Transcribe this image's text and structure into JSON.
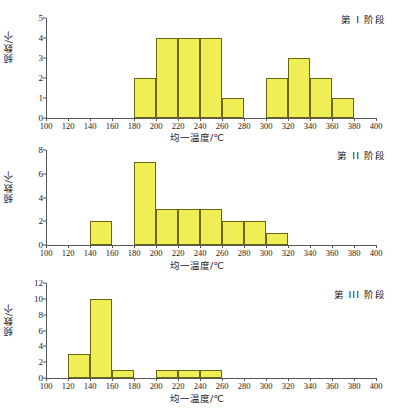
{
  "figure": {
    "axis_title_x": "均一温度/℃",
    "axis_title_y": "频数/个",
    "bar_fill": "#efee55",
    "bar_stroke": "#6b6616",
    "axis_color": "#555555"
  },
  "chart_data": [
    {
      "type": "bar",
      "title": "第 I 阶段",
      "xlabel": "均一温度/℃",
      "ylabel": "频数/个",
      "xlim": [
        100,
        400
      ],
      "ylim": [
        0,
        5
      ],
      "xticks": [
        100,
        120,
        140,
        160,
        180,
        200,
        220,
        240,
        260,
        280,
        300,
        320,
        340,
        360,
        380,
        400
      ],
      "yticks": [
        0,
        1,
        2,
        3,
        4,
        5
      ],
      "grid": false,
      "bin_width": 20,
      "bins": [
        {
          "start": 180,
          "end": 200,
          "value": 2
        },
        {
          "start": 200,
          "end": 220,
          "value": 4
        },
        {
          "start": 220,
          "end": 240,
          "value": 4
        },
        {
          "start": 240,
          "end": 260,
          "value": 4
        },
        {
          "start": 260,
          "end": 280,
          "value": 1
        },
        {
          "start": 300,
          "end": 320,
          "value": 2
        },
        {
          "start": 320,
          "end": 340,
          "value": 3
        },
        {
          "start": 340,
          "end": 360,
          "value": 2
        },
        {
          "start": 360,
          "end": 380,
          "value": 1
        }
      ]
    },
    {
      "type": "bar",
      "title": "第 II 阶段",
      "xlabel": "均一温度/℃",
      "ylabel": "频数/个",
      "xlim": [
        100,
        400
      ],
      "ylim": [
        0,
        8
      ],
      "xticks": [
        100,
        120,
        140,
        160,
        180,
        200,
        220,
        240,
        260,
        280,
        300,
        320,
        340,
        360,
        380,
        400
      ],
      "yticks": [
        0,
        2,
        4,
        6,
        8
      ],
      "grid": false,
      "bin_width": 20,
      "bins": [
        {
          "start": 140,
          "end": 160,
          "value": 2
        },
        {
          "start": 180,
          "end": 200,
          "value": 7
        },
        {
          "start": 200,
          "end": 220,
          "value": 3
        },
        {
          "start": 220,
          "end": 240,
          "value": 3
        },
        {
          "start": 240,
          "end": 260,
          "value": 3
        },
        {
          "start": 260,
          "end": 280,
          "value": 2
        },
        {
          "start": 280,
          "end": 300,
          "value": 2
        },
        {
          "start": 300,
          "end": 320,
          "value": 1
        }
      ]
    },
    {
      "type": "bar",
      "title": "第 III 阶段",
      "xlabel": "均一温度/℃",
      "ylabel": "频数/个",
      "xlim": [
        100,
        400
      ],
      "ylim": [
        0,
        12
      ],
      "xticks": [
        100,
        120,
        140,
        160,
        180,
        200,
        220,
        240,
        260,
        280,
        300,
        320,
        340,
        360,
        380,
        400
      ],
      "yticks": [
        0,
        2,
        4,
        6,
        8,
        10,
        12
      ],
      "grid": false,
      "bin_width": 20,
      "bins": [
        {
          "start": 120,
          "end": 140,
          "value": 3
        },
        {
          "start": 140,
          "end": 160,
          "value": 10
        },
        {
          "start": 160,
          "end": 180,
          "value": 1
        },
        {
          "start": 200,
          "end": 220,
          "value": 1
        },
        {
          "start": 220,
          "end": 240,
          "value": 1
        },
        {
          "start": 240,
          "end": 260,
          "value": 1
        }
      ]
    }
  ]
}
